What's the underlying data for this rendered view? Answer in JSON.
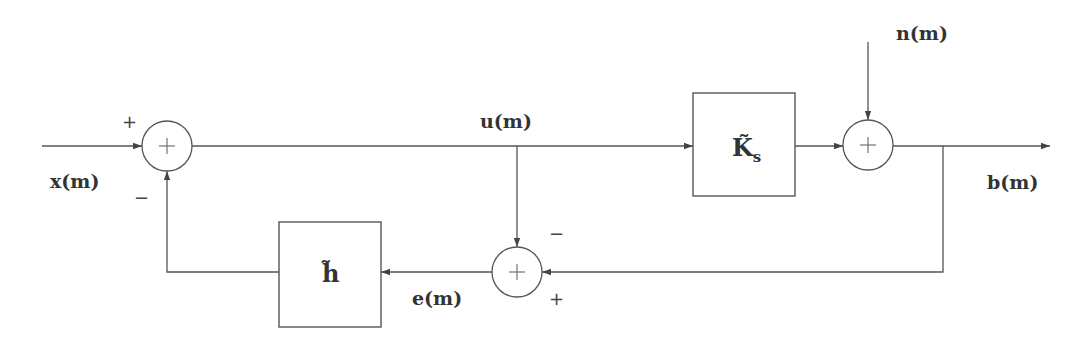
{
  "diagram": {
    "type": "block-diagram",
    "signals": {
      "input": "x(m)",
      "control": "u(m)",
      "noise": "n(m)",
      "output": "b(m)",
      "error": "e(m)"
    },
    "blocks": {
      "plant": {
        "symbol": "K̃",
        "subscript": "s"
      },
      "filter": {
        "symbol": "h̃"
      }
    },
    "summing_junctions": {
      "input_sum": {
        "symbol": "+",
        "signs": {
          "top": "+",
          "bottom": "−"
        }
      },
      "noise_sum": {
        "symbol": "+"
      },
      "error_sum": {
        "symbol": "+",
        "signs": {
          "top": "−",
          "bottom": "+"
        }
      }
    },
    "colors": {
      "line": "#555555",
      "text": "#333333",
      "background": "#ffffff"
    }
  }
}
